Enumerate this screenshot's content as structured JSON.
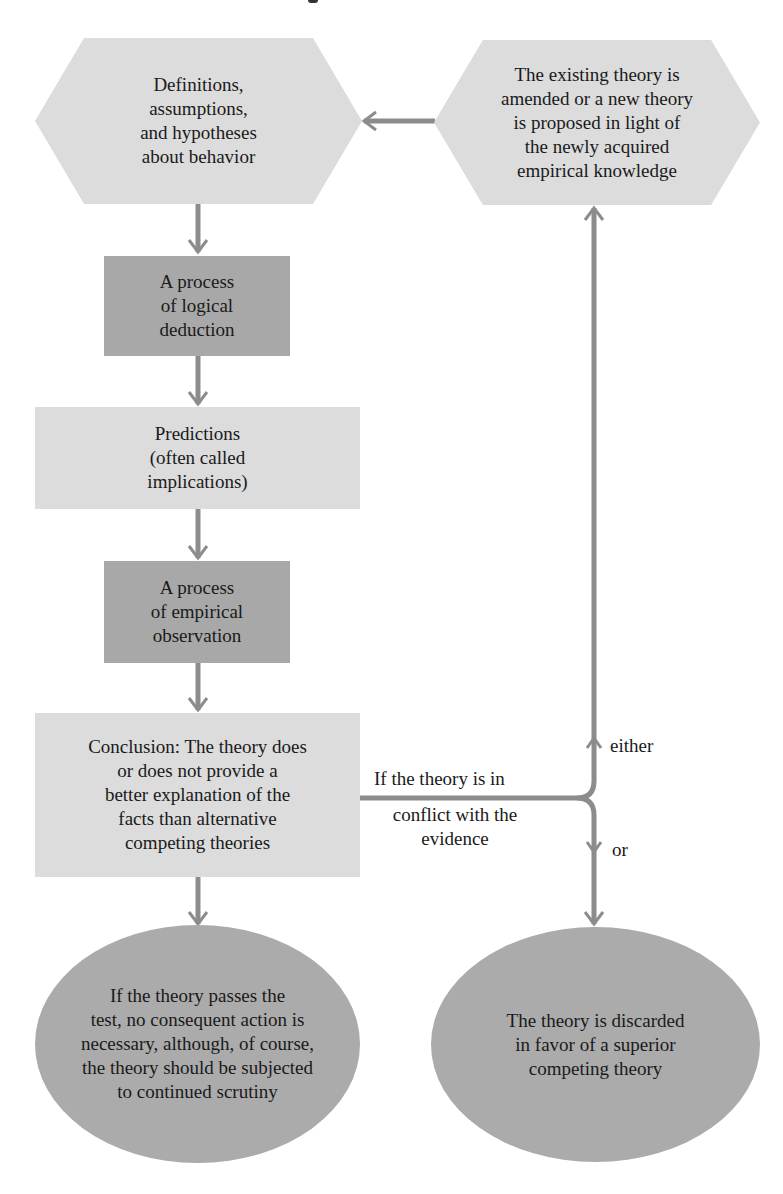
{
  "diagram": {
    "colors": {
      "light_fill": "#dcdcdc",
      "dark_fill": "#a8a8a8",
      "ellipse_fill": "#ababab",
      "connector": "#8c8c8c"
    },
    "nodes": {
      "hypotheses": {
        "shape": "hexagon",
        "text": "Definitions,\nassumptions,\nand hypotheses\nabout behavior"
      },
      "amended_theory": {
        "shape": "hexagon",
        "text": "The existing theory is\namended or a new theory\nis proposed in light of\nthe newly acquired\nempirical knowledge"
      },
      "logical_deduction": {
        "shape": "rectangle-dark",
        "text": "A process\nof logical\ndeduction"
      },
      "predictions": {
        "shape": "rectangle-light",
        "text": "Predictions\n(often called\nimplications)"
      },
      "empirical_observation": {
        "shape": "rectangle-dark",
        "text": "A process\nof empirical\nobservation"
      },
      "conclusion": {
        "shape": "rectangle-light",
        "text": "Conclusion: The theory does\nor does not provide a\nbetter explanation of the\nfacts than alternative\ncompeting theories"
      },
      "passes_test": {
        "shape": "ellipse",
        "text": "If the theory passes the\ntest, no consequent action is\nnecessary, although, of course,\nthe theory should be subjected\nto continued scrutiny"
      },
      "discarded": {
        "shape": "ellipse",
        "text": "The theory is discarded\nin favor of a superior\ncompeting theory"
      }
    },
    "edge_labels": {
      "conflict_above": "If the theory is in",
      "conflict_below": "conflict with the\nevidence",
      "either": "either",
      "or": "or"
    },
    "edges": [
      {
        "from": "hypotheses",
        "to": "logical_deduction"
      },
      {
        "from": "logical_deduction",
        "to": "predictions"
      },
      {
        "from": "predictions",
        "to": "empirical_observation"
      },
      {
        "from": "empirical_observation",
        "to": "conclusion"
      },
      {
        "from": "conclusion",
        "to": "passes_test"
      },
      {
        "from": "conclusion",
        "to": "amended_theory",
        "label": "either"
      },
      {
        "from": "conclusion",
        "to": "discarded",
        "label": "or"
      },
      {
        "from": "amended_theory",
        "to": "hypotheses"
      }
    ]
  }
}
